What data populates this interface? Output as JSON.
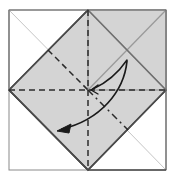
{
  "figure": {
    "canvas": {
      "width": 172,
      "height": 182
    },
    "colors": {
      "paper_fill": "#d4d4d4",
      "paper_fill_light": "#dcdcdc",
      "white_fill": "#ffffff",
      "edge_dark": "#3a3a3a",
      "edge_mid": "#8a8a8a",
      "edge_light": "#bbbbbb",
      "crease_dashed": "#2b2b2b",
      "arrow_color": "#1a1a1a",
      "background": "#ffffff"
    },
    "geometry": {
      "center": {
        "x": 88,
        "y": 90
      },
      "outer_square": {
        "left": 9,
        "top": 10,
        "right": 166,
        "bottom": 170
      },
      "diamond_vertices": [
        {
          "name": "top",
          "x": 88,
          "y": 10
        },
        {
          "name": "right",
          "x": 166,
          "y": 90
        },
        {
          "name": "bottom",
          "x": 88,
          "y": 170
        },
        {
          "name": "left",
          "x": 9,
          "y": 90
        }
      ],
      "quadrants": [
        {
          "name": "top-left",
          "fill": "white"
        },
        {
          "name": "top-right",
          "fill": "gray"
        },
        {
          "name": "bottom-left",
          "fill": "gray"
        },
        {
          "name": "bottom-right",
          "fill": "white"
        }
      ]
    },
    "creases": [
      {
        "name": "vertical-center-crease",
        "style": "dashed",
        "from": {
          "x": 88,
          "y": 10
        },
        "to": {
          "x": 88,
          "y": 170
        }
      },
      {
        "name": "horizontal-center-crease",
        "style": "dashed",
        "from": {
          "x": 9,
          "y": 90
        },
        "to": {
          "x": 166,
          "y": 90
        }
      },
      {
        "name": "diagonal-crease-upper-left",
        "style": "dashed",
        "from": {
          "x": 48,
          "y": 50
        },
        "to": {
          "x": 88,
          "y": 90
        }
      },
      {
        "name": "diagonal-crease-lower-right",
        "style": "dash-dot",
        "from": {
          "x": 88,
          "y": 90
        },
        "to": {
          "x": 128,
          "y": 130
        }
      }
    ],
    "arrows": [
      {
        "name": "fold-arrow-to-center",
        "path": "M127,60 C116,76 104,84 93,89",
        "head_at": {
          "x": 90,
          "y": 90
        },
        "head_angle_deg": 200
      },
      {
        "name": "fold-arrow-to-lower-left",
        "path": "M127,61 C124,92 100,120 62,129",
        "head_at": {
          "x": 58,
          "y": 130
        },
        "head_angle_deg": 195
      }
    ],
    "labels": []
  }
}
